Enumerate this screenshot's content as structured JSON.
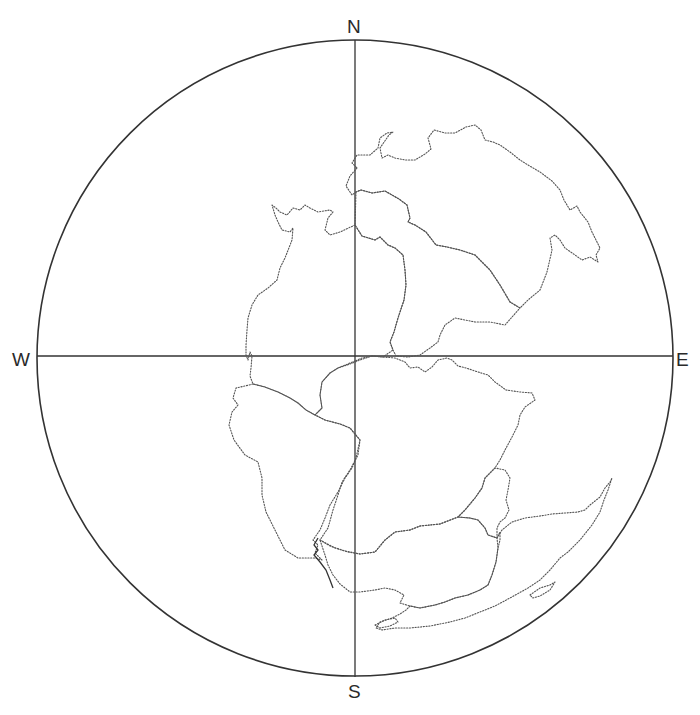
{
  "figure": {
    "type": "polar-globe-projection",
    "compass": {
      "north": "N",
      "south": "S",
      "west": "W",
      "east": "E"
    },
    "colors": {
      "background": "#ffffff",
      "circle": "#333333",
      "axes": "#333333",
      "coastlines": "#555555"
    },
    "circle": {
      "cx": 355,
      "cy": 358,
      "r": 318
    },
    "landmasses": [
      {
        "name": "north-eurasia"
      },
      {
        "name": "north-america-greenland"
      },
      {
        "name": "central-eurasia"
      },
      {
        "name": "africa"
      },
      {
        "name": "south-america"
      },
      {
        "name": "antarctica"
      },
      {
        "name": "india"
      },
      {
        "name": "australia"
      }
    ]
  }
}
